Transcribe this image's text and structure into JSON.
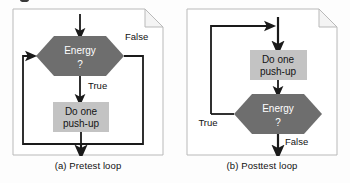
{
  "figure": {
    "background_color": "#fdfdfd",
    "panel_border_color": "#b9b9b9",
    "panel_fill_color": "#ffffff",
    "decision_fill_color": "#6e6e6e",
    "decision_text_color": "#ffffff",
    "process_fill_color": "#c3c3c3",
    "process_text_color": "#141414",
    "line_color": "#1a1a1a",
    "dogear_fill_color": "#f4f4f4"
  },
  "panels": [
    {
      "id": "pretest",
      "caption": "(a) Pretest loop",
      "decision": {
        "line1": "Energy",
        "line2": "?"
      },
      "process": {
        "line1": "Do one",
        "line2": "push-up"
      },
      "branches": {
        "true_label": "True",
        "false_label": "False"
      }
    },
    {
      "id": "posttest",
      "caption": "(b) Posttest loop",
      "decision": {
        "line1": "Energy",
        "line2": "?"
      },
      "process": {
        "line1": "Do one",
        "line2": "push-up"
      },
      "branches": {
        "true_label": "True",
        "false_label": "False"
      }
    }
  ]
}
